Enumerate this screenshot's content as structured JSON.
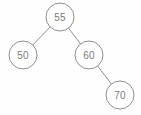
{
  "figure": {
    "background_color": "#fefefe",
    "stroke_color": "#8f8f8f",
    "text_color": "#7a7a7a",
    "node_fill": "#ffffff",
    "width": 141,
    "height": 115
  },
  "chart_data": {
    "type": "diagram",
    "diagram_type": "binary-tree",
    "title": "",
    "nodes": [
      {
        "id": "n55",
        "label": "55",
        "cx": 60,
        "cy": 17,
        "r": 14,
        "role": "root",
        "depth": 0
      },
      {
        "id": "n50",
        "label": "50",
        "cx": 23,
        "cy": 55,
        "r": 14,
        "role": "left-child",
        "depth": 1
      },
      {
        "id": "n60",
        "label": "60",
        "cx": 89,
        "cy": 55,
        "r": 14,
        "role": "right-child",
        "depth": 1
      },
      {
        "id": "n70",
        "label": "70",
        "cx": 120,
        "cy": 95,
        "r": 14,
        "role": "right-child",
        "depth": 2
      }
    ],
    "edges": [
      {
        "from": "n55",
        "to": "n50",
        "x1": 50,
        "y1": 27,
        "x2": 33,
        "y2": 45
      },
      {
        "from": "n55",
        "to": "n60",
        "x1": 70,
        "y1": 27,
        "x2": 79,
        "y2": 45
      },
      {
        "from": "n60",
        "to": "n70",
        "x1": 99,
        "y1": 65,
        "x2": 110,
        "y2": 85
      }
    ]
  }
}
